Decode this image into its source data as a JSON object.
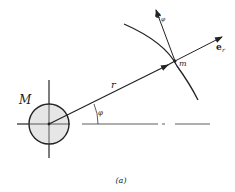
{
  "figure": {
    "caption": "(a)",
    "mass_central": "M",
    "mass_orbiting": "m",
    "radius_vector": "r",
    "angle": "φ",
    "unit_radial": {
      "base": "e",
      "sub": "r"
    },
    "unit_angular": {
      "base": "e",
      "sub": "φ"
    }
  },
  "colors": {
    "ink": "#222222",
    "circle_fill": "#e6e6e6",
    "background": "#ffffff"
  }
}
